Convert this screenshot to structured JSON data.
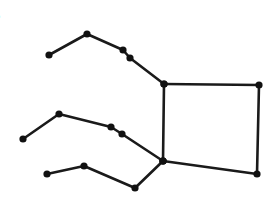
{
  "figure": {
    "stroke_color": "#1a1a1a",
    "node_color": "#111111",
    "background": "#ffffff",
    "edge_text_fragments": [
      {
        "text": "e",
        "y": 18
      },
      {
        "text": "s",
        "y": 47
      },
      {
        "text": "s",
        "y": 70
      }
    ],
    "quadrilateral": {
      "nodes": [
        {
          "id": "q_tl",
          "x": 164,
          "y": 84
        },
        {
          "id": "q_tr",
          "x": 259,
          "y": 85
        },
        {
          "id": "q_br",
          "x": 257,
          "y": 174
        },
        {
          "id": "q_bl",
          "x": 163,
          "y": 161
        }
      ]
    },
    "chains": [
      {
        "name": "top-chain",
        "nodes": [
          {
            "x": 49,
            "y": 55
          },
          {
            "x": 87,
            "y": 34
          },
          {
            "x": 123,
            "y": 50
          },
          {
            "x": 130,
            "y": 58
          },
          {
            "x": 164,
            "y": 84
          }
        ]
      },
      {
        "name": "middle-chain",
        "nodes": [
          {
            "x": 23,
            "y": 139
          },
          {
            "x": 59,
            "y": 114
          },
          {
            "x": 111,
            "y": 127
          },
          {
            "x": 122,
            "y": 134
          },
          {
            "x": 163,
            "y": 161
          }
        ]
      },
      {
        "name": "bottom-chain",
        "nodes": [
          {
            "x": 47,
            "y": 174
          },
          {
            "x": 84,
            "y": 166
          },
          {
            "x": 135,
            "y": 188
          },
          {
            "x": 163,
            "y": 161
          }
        ]
      }
    ]
  }
}
